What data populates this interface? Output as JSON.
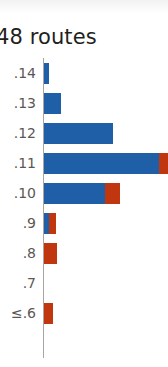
{
  "chart_data": {
    "type": "bar",
    "orientation": "horizontal",
    "stacked": true,
    "title": "48 routes",
    "xlabel": "",
    "ylabel": "",
    "grid": false,
    "legend_position": "none",
    "categories": [
      ".14",
      ".13",
      ".12",
      ".11",
      ".10",
      ".9",
      ".8",
      ".7",
      "≤.6"
    ],
    "series": [
      {
        "name": "blue",
        "color": "#1f5fa8",
        "values": [
          5,
          17,
          69,
          115,
          61,
          5,
          0,
          0,
          0
        ]
      },
      {
        "name": "red",
        "color": "#c0360f",
        "values": [
          0,
          0,
          0,
          10,
          15,
          7,
          13,
          0,
          9
        ]
      }
    ],
    "xlim": [
      0,
      125
    ]
  },
  "colors": {
    "blue": "#1f5fa8",
    "red": "#c0360f",
    "axis": "#a8a5a3",
    "title_text": "#231f20",
    "tick_text": "#5b5755",
    "background": "#ffffff"
  }
}
